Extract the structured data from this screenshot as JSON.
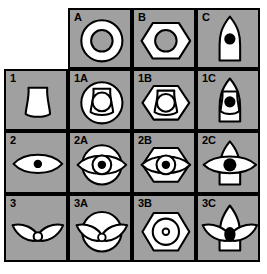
{
  "figure": {
    "type": "matrix-grid",
    "title": "",
    "background_color": "#ffffff",
    "cell_fill": "#a0a0a0",
    "shape_fill": "#ffffff",
    "outline_color": "#000000",
    "dot_color": "#000000",
    "columns": 4,
    "rows": 4,
    "column_headers": [
      "",
      "A",
      "B",
      "C"
    ],
    "row_headers": [
      "",
      "1",
      "2",
      "3"
    ]
  },
  "cells": [
    {
      "id": "corner",
      "label": "",
      "blank": true,
      "shape": "none",
      "row": 0,
      "col": 0
    },
    {
      "id": "A",
      "label": "A",
      "blank": false,
      "shape": "circle-ring",
      "row": 0,
      "col": 1
    },
    {
      "id": "B",
      "label": "B",
      "blank": false,
      "shape": "hexagon-ring",
      "row": 0,
      "col": 2
    },
    {
      "id": "C",
      "label": "C",
      "blank": false,
      "shape": "bullet-dot",
      "row": 0,
      "col": 3
    },
    {
      "id": "1",
      "label": "1",
      "blank": false,
      "shape": "barrel",
      "row": 1,
      "col": 0
    },
    {
      "id": "1A",
      "label": "1A",
      "blank": false,
      "shape": "circle-barrel",
      "row": 1,
      "col": 1
    },
    {
      "id": "1B",
      "label": "1B",
      "blank": false,
      "shape": "hexagon-barrel",
      "row": 1,
      "col": 2
    },
    {
      "id": "1C",
      "label": "1C",
      "blank": false,
      "shape": "bullet-barrel-dot",
      "row": 1,
      "col": 3
    },
    {
      "id": "2",
      "label": "2",
      "blank": false,
      "shape": "eye-dot",
      "row": 2,
      "col": 0
    },
    {
      "id": "2A",
      "label": "2A",
      "blank": false,
      "shape": "circle-eye-dot",
      "row": 2,
      "col": 1
    },
    {
      "id": "2B",
      "label": "2B",
      "blank": false,
      "shape": "hexagon-eye-dot",
      "row": 2,
      "col": 2
    },
    {
      "id": "2C",
      "label": "2C",
      "blank": false,
      "shape": "bullet-eye-dot",
      "row": 2,
      "col": 3
    },
    {
      "id": "3",
      "label": "3",
      "blank": false,
      "shape": "wings-ring",
      "row": 3,
      "col": 0
    },
    {
      "id": "3A",
      "label": "3A",
      "blank": false,
      "shape": "circle-wings",
      "row": 3,
      "col": 1
    },
    {
      "id": "3B",
      "label": "3B",
      "blank": false,
      "shape": "hexagon-circle-ring",
      "row": 3,
      "col": 2
    },
    {
      "id": "3C",
      "label": "3C",
      "blank": false,
      "shape": "bullet-wings-dot",
      "row": 3,
      "col": 3
    }
  ]
}
